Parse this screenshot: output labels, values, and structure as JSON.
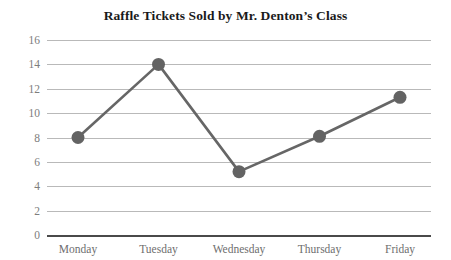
{
  "chart_data": {
    "type": "line",
    "title": "Raffle Tickets Sold by Mr. Denton’s Class",
    "xlabel": "",
    "ylabel": "",
    "categories": [
      "Monday",
      "Tuesday",
      "Wednesday",
      "Thursday",
      "Friday"
    ],
    "values": [
      8.0,
      14.0,
      5.2,
      8.1,
      11.3
    ],
    "series": [
      {
        "name": "Raffle Tickets Sold",
        "values": [
          8.0,
          14.0,
          5.2,
          8.1,
          11.3
        ]
      }
    ],
    "ylim": [
      0,
      16
    ],
    "ytick_step": 2,
    "yticks": [
      16,
      14,
      12,
      10,
      8,
      6,
      4,
      2,
      0
    ],
    "ytick_labels": [
      "16",
      "14",
      "12",
      "10",
      "8",
      "6",
      "4",
      "2",
      "0"
    ],
    "grid": true,
    "grid_axis": "y",
    "legend": false,
    "legend_position": "none",
    "marker": "circle",
    "colors": {
      "line": "#666666",
      "marker": "#636363",
      "gridline": "#b9b9b9",
      "baseline": "#4a4a4a",
      "tick_text": "#7d7d7d",
      "title_text": "#1a1a1a",
      "background": "#ffffff"
    }
  }
}
